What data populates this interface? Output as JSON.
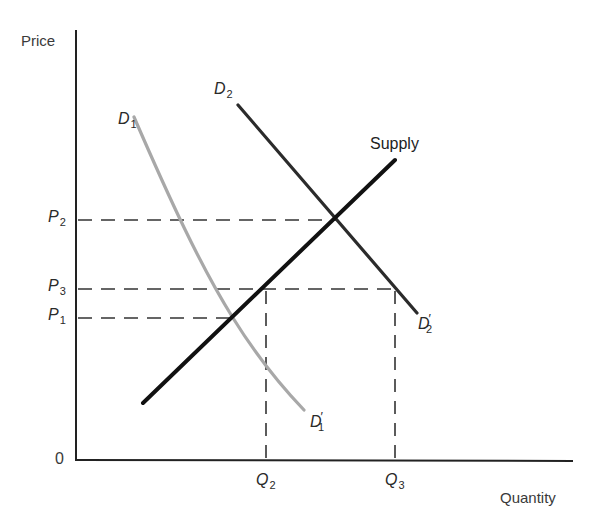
{
  "diagram": {
    "type": "supply-demand",
    "axes": {
      "y_label": "Price",
      "x_label": "Quantity",
      "origin_label": "0"
    },
    "price_levels": [
      {
        "id": "P2",
        "letter": "P",
        "sub": "2",
        "y": 220,
        "extends_to_x": 338
      },
      {
        "id": "P3",
        "letter": "P",
        "sub": "3",
        "y": 289,
        "extends_to_x": 395
      },
      {
        "id": "P1",
        "letter": "P",
        "sub": "1",
        "y": 318,
        "extends_to_x": 233
      }
    ],
    "quantity_levels": [
      {
        "id": "Q2",
        "letter": "Q",
        "sub": "2",
        "x": 266,
        "from_y": 289
      },
      {
        "id": "Q3",
        "letter": "Q",
        "sub": "3",
        "x": 395,
        "from_y": 289
      }
    ],
    "curves": [
      {
        "id": "supply",
        "label": "Supply",
        "color": "#111111",
        "width": 4
      },
      {
        "id": "D2",
        "label_start": {
          "letter": "D",
          "sub": "2"
        },
        "label_end": {
          "letter": "D",
          "sub": "2",
          "prime": "′"
        },
        "color": "#2b2b2b",
        "width": 3.2
      },
      {
        "id": "D1",
        "label_start": {
          "letter": "D",
          "sub": "1"
        },
        "label_end": {
          "letter": "D",
          "sub": "1",
          "prime": "′"
        },
        "color": "#a8a8a8",
        "width": 3.2
      }
    ],
    "colors": {
      "axis": "#222222",
      "dash": "#333333",
      "background": "#ffffff"
    }
  }
}
